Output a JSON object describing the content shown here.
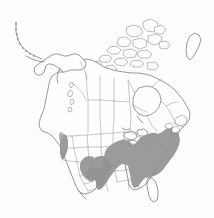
{
  "figure": {
    "kind": "species-distribution-map",
    "region": "North America",
    "title": "",
    "caption": "",
    "background_color": "#fdfdfd",
    "outline_color": "#6e6e6e",
    "subdivision_color": "#9a9a9a",
    "range_color": "#929292",
    "unshaded_color": "#fefefe"
  },
  "legend": {
    "present_label": "",
    "absent_label": "",
    "visible": false
  },
  "map": {
    "countries": [
      {
        "name": "Canada",
        "shaded": false
      },
      {
        "name": "United States",
        "shaded": true
      },
      {
        "name": "Mexico",
        "shaded": false
      },
      {
        "name": "Greenland",
        "shaded": false
      }
    ],
    "shaded_regions": [
      {
        "name": "eastern-united-states",
        "type": "polygon",
        "note": "Contiguous shading from east Texas and the Gulf Coast north through the Midwest and east to New England"
      },
      {
        "name": "pacific-northwest-coast",
        "type": "polygon",
        "note": "Narrow coastal band in western Oregon and northwest California"
      },
      {
        "name": "southern-plains-spot",
        "type": "ellipse",
        "note": "Isolated oval spot over north Texas / southern Oklahoma"
      }
    ],
    "unshaded_notable": [
      {
        "name": "florida-peninsula"
      },
      {
        "name": "west-texas"
      },
      {
        "name": "great-basin"
      },
      {
        "name": "northern-plains"
      },
      {
        "name": "canada"
      }
    ]
  },
  "geography": {
    "mainland_outline": "M 43 146 L 40 139 L 40 130 L 42 122 L 45 114 L 48 106 L 50 99 L 53 94 L 56 89 L 58 84 L 56 79 L 52 75 L 47 72 L 41 70 L 36 68 L 31 65 L 27 62 L 24 58 L 21 55 L 18 52 L 15 50 L 13 48",
    "aleutians_note": "Dotted island arc trailing southwest from the Alaska Peninsula",
    "arctic_note": "Canadian Arctic Archipelago rendered as clustered irregular islands across the north",
    "great_lakes_note": "Five lakes drawn as white voids at the US-Canada border"
  },
  "icons": {
    "map_icon": "map-icon"
  }
}
